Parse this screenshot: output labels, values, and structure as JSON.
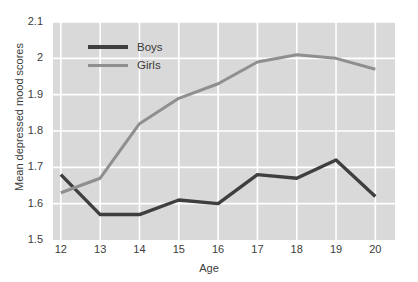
{
  "chart_data": {
    "type": "line",
    "title": "",
    "xlabel": "Age",
    "ylabel": "Mean depressed mood scores",
    "x": [
      12,
      13,
      14,
      15,
      16,
      17,
      18,
      19,
      20
    ],
    "xticklabels": [
      "12",
      "13",
      "14",
      "15",
      "16",
      "17",
      "18",
      "19",
      "20"
    ],
    "yticklabels": [
      "2.1",
      "2",
      "1.9",
      "1.8",
      "1.7",
      "1.6",
      "1.5"
    ],
    "yticks": [
      2.1,
      2.0,
      1.9,
      1.8,
      1.7,
      1.6,
      1.5
    ],
    "xlim": [
      11.8,
      20.5
    ],
    "ylim": [
      1.5,
      2.1
    ],
    "grid": true,
    "legend_position": "upper-left-inside",
    "series": [
      {
        "name": "Boys",
        "color": "#3f3f3f",
        "values": [
          1.68,
          1.57,
          1.57,
          1.61,
          1.6,
          1.68,
          1.67,
          1.72,
          1.62
        ]
      },
      {
        "name": "Girls",
        "color": "#8f8f8f",
        "values": [
          1.63,
          1.67,
          1.82,
          1.89,
          1.93,
          1.99,
          2.01,
          2.0,
          1.97
        ]
      }
    ]
  },
  "legend": {
    "items": [
      {
        "label": "Boys",
        "color": "#3f3f3f"
      },
      {
        "label": "Girls",
        "color": "#8f8f8f"
      }
    ]
  },
  "axes": {
    "x_title": "Age",
    "y_title": "Mean depressed mood scores"
  },
  "style": {
    "plot_background": "#d9d9d9",
    "grid_color": "#ffffff",
    "page_background": "#ffffff",
    "text_color": "#3c3c3c"
  }
}
